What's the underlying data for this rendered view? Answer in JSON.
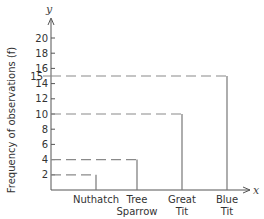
{
  "chart_data": {
    "type": "bar",
    "style": "line-graph (vertical lines with dashed guides to y-axis)",
    "title": "",
    "xlabel": "x",
    "ylabel": "Frequency of observations (f)",
    "y_axis_letter": "y",
    "x_axis_letter": "x",
    "categories": [
      "Nuthatch",
      "Tree Sparrow",
      "Great Tit",
      "Blue Tit"
    ],
    "category_lines": [
      [
        "Nuthatch"
      ],
      [
        "Tree",
        "Sparrow"
      ],
      [
        "Great",
        "Tit"
      ],
      [
        "Blue",
        "Tit"
      ]
    ],
    "values": [
      2,
      4,
      10,
      15
    ],
    "ylim": [
      0,
      20
    ],
    "yticks": [
      2,
      4,
      6,
      8,
      10,
      12,
      14,
      16,
      18,
      20
    ],
    "extra_ytick_label": "15",
    "grid": false,
    "legend": null,
    "colors": {
      "axis": "#555555",
      "bar": "#777777",
      "dash": "#8a8a8a",
      "text": "#333333"
    }
  }
}
